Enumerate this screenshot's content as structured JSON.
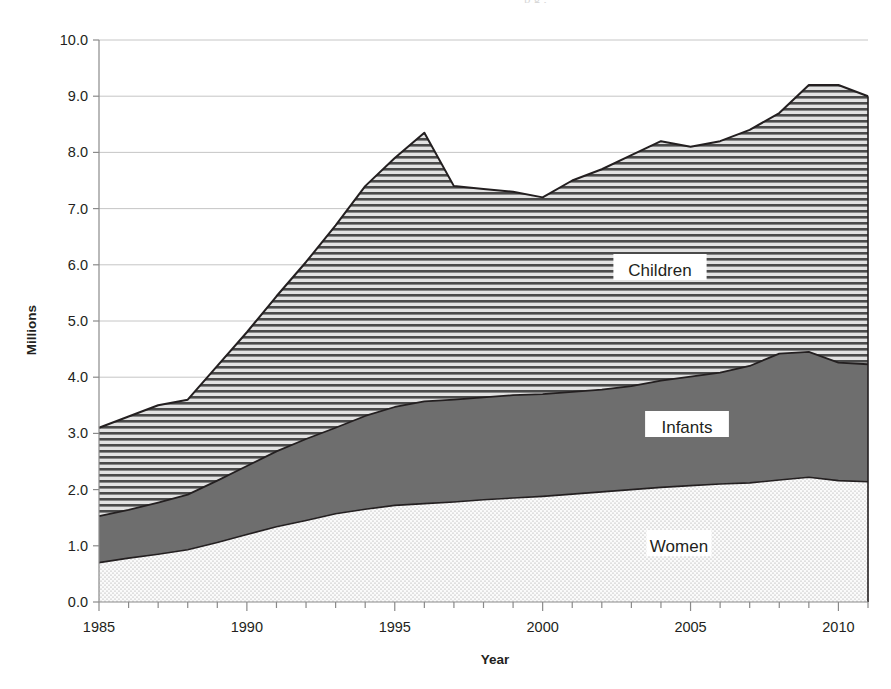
{
  "figure": {
    "bleed_text": "p g ,",
    "background_color": "#ffffff",
    "ink_color": "#231f20"
  },
  "axes": {
    "y": {
      "title": "Millions",
      "min": 0.0,
      "max": 10.0,
      "step": 1.0,
      "ticks": [
        "0.0",
        "1.0",
        "2.0",
        "3.0",
        "4.0",
        "5.0",
        "6.0",
        "7.0",
        "8.0",
        "9.0",
        "10.0"
      ],
      "gridlines": true
    },
    "x": {
      "title": "Year",
      "min": 1985,
      "max": 2011,
      "major_step": 5,
      "minor_step": 1,
      "ticks": [
        "1985",
        "1990",
        "1995",
        "2000",
        "2005",
        "2010"
      ]
    }
  },
  "series_labels": {
    "children": "Children",
    "infants": "Infants",
    "women": "Women"
  },
  "colors": {
    "children_fill": "#d8d8d8",
    "children_pattern": "horizontal-lines",
    "infants_fill": "#6e6e6e",
    "infants_pattern": "solid",
    "women_fill": "#fafafa",
    "women_pattern": "fine-dots",
    "outline": "#231f20",
    "grid": "#bfbfbf"
  },
  "chart_data": {
    "type": "area",
    "stacked": true,
    "title": "",
    "xlabel": "Year",
    "ylabel": "Millions",
    "xlim": [
      1985,
      2011
    ],
    "ylim": [
      0.0,
      10.0
    ],
    "grid": true,
    "legend": "inline-labels",
    "x": [
      1985,
      1986,
      1987,
      1988,
      1989,
      1990,
      1991,
      1992,
      1993,
      1994,
      1995,
      1996,
      1997,
      1998,
      1999,
      2000,
      2001,
      2002,
      2003,
      2004,
      2005,
      2006,
      2007,
      2008,
      2009,
      2010,
      2011
    ],
    "series": [
      {
        "name": "Women",
        "values": [
          0.7,
          0.78,
          0.85,
          0.93,
          1.06,
          1.2,
          1.34,
          1.45,
          1.57,
          1.65,
          1.72,
          1.75,
          1.78,
          1.82,
          1.85,
          1.88,
          1.92,
          1.96,
          2.0,
          2.04,
          2.07,
          2.1,
          2.12,
          2.17,
          2.22,
          2.16,
          2.14
        ]
      },
      {
        "name": "Infants",
        "values": [
          0.83,
          0.86,
          0.92,
          0.98,
          1.1,
          1.22,
          1.34,
          1.45,
          1.53,
          1.66,
          1.75,
          1.82,
          1.82,
          1.82,
          1.83,
          1.82,
          1.82,
          1.82,
          1.84,
          1.9,
          1.94,
          1.98,
          2.08,
          2.25,
          2.23,
          2.1,
          2.09
        ]
      },
      {
        "name": "Children",
        "values": [
          1.57,
          1.66,
          1.73,
          1.69,
          2.04,
          2.38,
          2.76,
          3.15,
          3.6,
          4.09,
          4.43,
          4.78,
          3.8,
          3.71,
          3.62,
          3.5,
          3.76,
          3.92,
          4.11,
          4.26,
          4.09,
          4.12,
          4.2,
          4.28,
          4.75,
          4.94,
          4.77
        ]
      }
    ],
    "stack_top_totals": [
      3.1,
      3.3,
      3.5,
      3.6,
      4.2,
      4.8,
      5.44,
      6.05,
      6.7,
      7.4,
      7.9,
      8.35,
      7.4,
      7.35,
      7.3,
      7.2,
      7.5,
      7.7,
      7.95,
      8.2,
      8.1,
      8.2,
      8.4,
      8.7,
      9.2,
      9.2,
      9.0
    ],
    "notes": {
      "children_top_1985": 3.1,
      "children_top_1988": 3.6,
      "children_top_1997_peak": 7.4,
      "children_top_2000_dip": 7.2,
      "children_top_2009_peak": 9.2,
      "children_top_2011": 9.0,
      "infants_top_2008_peak": 4.45,
      "infants_top_2011": 4.23,
      "women_1985": 0.7,
      "women_2009_peak": 2.22,
      "women_2011": 2.14
    }
  }
}
